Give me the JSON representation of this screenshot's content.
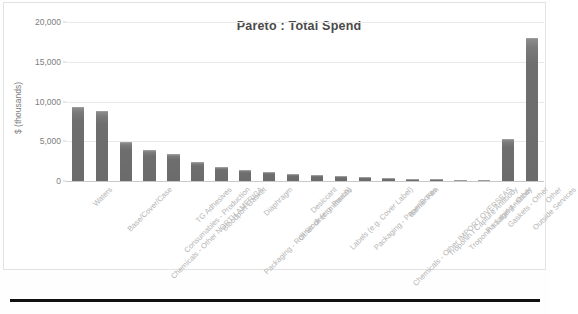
{
  "chart_data": {
    "type": "bar",
    "title": "Pareto :  Total Spend",
    "xlabel": "",
    "ylabel": "$ (thousands)",
    "ylim": [
      0,
      20000
    ],
    "yticks": [
      0,
      5000,
      10000,
      15000,
      20000
    ],
    "ytick_labels": [
      "0",
      "5,000",
      "10,000",
      "15,000",
      "20,000"
    ],
    "grid": true,
    "legend": "none",
    "bar_color": "#6e6e6e",
    "categories": [
      "Waters",
      "Base/Cover/Case",
      "Chemicals - Other NORTH AMERICA",
      "Consumables - Production",
      "TG Adhesives",
      "Bloodport Gasket",
      "Packaging - Roll Stock (e.g. Pouch)",
      "Diaphragm",
      "Other direct materials",
      "Desiccant",
      "Labels (e.g. Cover Label)",
      "Packaging - Paper/Boxes",
      "Chemicals - Other IMPORT OVERSEAS",
      "Barrier Film",
      "Troponin I Capture Antibody",
      "Troponin I Label Antibody",
      "Packaging - Other",
      "Gaskets - Other",
      "Outside Services",
      "Other"
    ],
    "values": [
      9300,
      8850,
      4950,
      3850,
      3350,
      2450,
      1750,
      1350,
      1150,
      900,
      750,
      620,
      520,
      330,
      260,
      200,
      150,
      120,
      5300,
      17950
    ]
  },
  "axis": {
    "y_title": "$ (thousands)"
  }
}
